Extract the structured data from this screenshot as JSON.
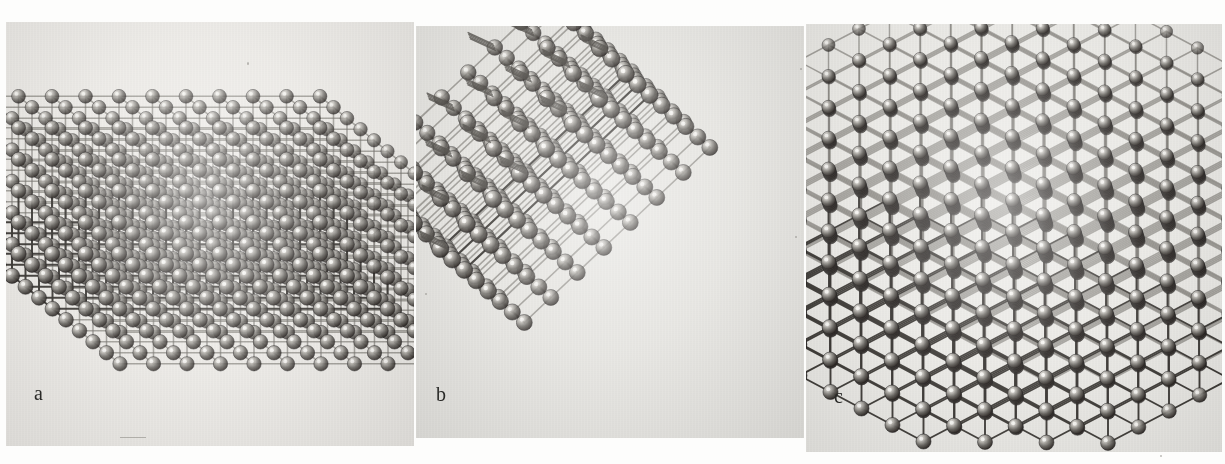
{
  "figure": {
    "kind": "photographic-plate",
    "background_color": "#fdfdfc",
    "panel_background_color": "#eceae6",
    "ink_color": "#1d1c1a",
    "sphere_color": "#3a3835",
    "sphere_highlight_color": "#f2f0ec",
    "rod_color": "#55524d"
  },
  "panels": [
    {
      "id": "a",
      "label": "a",
      "caption_letter": "a",
      "description": "cubic close-packed lattice model viewed face-on, roughly cube shaped block",
      "rows": 11,
      "cols": 11,
      "depth": 6,
      "x": 6,
      "y": 22,
      "w": 408,
      "h": 424
    },
    {
      "id": "b",
      "label": "b",
      "caption_letter": "b",
      "description": "lattice model rotated 45 degrees showing a diamond or rhombic outline with protruding rods",
      "rows": 8,
      "cols": 8,
      "depth": 4,
      "x": 416,
      "y": 26,
      "w": 388,
      "h": 412
    },
    {
      "id": "c",
      "label": "c",
      "caption_letter": "c",
      "description": "lattice model viewed along a body diagonal giving a hexagonal silhouette",
      "rows": 11,
      "cols": 11,
      "depth": 8,
      "x": 806,
      "y": 24,
      "w": 416,
      "h": 428
    }
  ],
  "chart_data": {
    "type": "table",
    "title": "",
    "categories": [
      "a",
      "b",
      "c"
    ],
    "values": [
      11,
      8,
      11
    ],
    "series": [
      {
        "name": "lattice rows",
        "values": [
          11,
          8,
          11
        ]
      },
      {
        "name": "lattice columns",
        "values": [
          11,
          8,
          11
        ]
      },
      {
        "name": "visible layers in depth",
        "values": [
          6,
          4,
          8
        ]
      }
    ],
    "xlabel": "panel",
    "ylabel": "lattice count",
    "ylim": [
      0,
      12
    ],
    "grid": false,
    "legend": "none"
  }
}
